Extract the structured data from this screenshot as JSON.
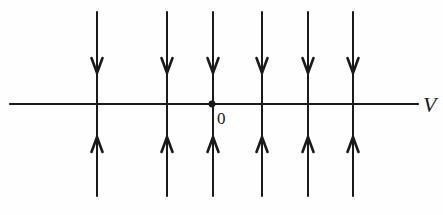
{
  "figure": {
    "kind": "phase-line-direction-field",
    "background_color": "#fefefe",
    "stroke_color": "#1a1a1a",
    "width": 443,
    "height": 215
  },
  "axis": {
    "name": "horizontal-axis",
    "label": "V",
    "label_x": 423,
    "label_y": 112,
    "x_start": 10,
    "x_end": 418,
    "y": 104,
    "stroke_width": 2.2
  },
  "origin": {
    "label": "0",
    "dot_x": 212,
    "dot_y": 104,
    "dot_radius": 3.4,
    "label_x": 217,
    "label_y": 124
  },
  "flow_lines": {
    "count": 6,
    "x_positions": [
      97,
      167,
      213,
      262,
      308,
      353
    ],
    "top_y": 12,
    "bottom_y": 196,
    "stroke_width": 2.0,
    "arrow_down_tip_y": 73,
    "arrow_up_tip_y": 137,
    "arrow_half_width": 5.5,
    "arrow_length": 15,
    "direction_above_axis": "down",
    "direction_below_axis": "up"
  },
  "chart_data": {
    "type": "line",
    "title": "",
    "xlabel": "V",
    "ylabel": "",
    "grid": false,
    "legend": null,
    "annotations": [
      "0",
      "V"
    ],
    "series": [
      {
        "name": "flow-line-1",
        "x": 97,
        "y_top": 12,
        "y_bottom": 196,
        "arrow_above": "down",
        "arrow_below": "up"
      },
      {
        "name": "flow-line-2",
        "x": 167,
        "y_top": 12,
        "y_bottom": 196,
        "arrow_above": "down",
        "arrow_below": "up"
      },
      {
        "name": "flow-line-3",
        "x": 213,
        "y_top": 12,
        "y_bottom": 196,
        "arrow_above": "down",
        "arrow_below": "up"
      },
      {
        "name": "flow-line-4",
        "x": 262,
        "y_top": 12,
        "y_bottom": 196,
        "arrow_above": "down",
        "arrow_below": "up"
      },
      {
        "name": "flow-line-5",
        "x": 308,
        "y_top": 12,
        "y_bottom": 196,
        "arrow_above": "down",
        "arrow_below": "up"
      },
      {
        "name": "flow-line-6",
        "x": 353,
        "y_top": 12,
        "y_bottom": 196,
        "arrow_above": "down",
        "arrow_below": "up"
      }
    ]
  }
}
